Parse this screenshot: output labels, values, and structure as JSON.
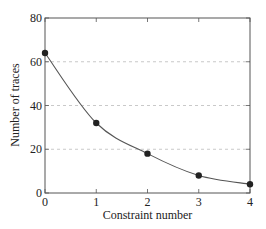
{
  "chart_data": {
    "type": "line",
    "title": "",
    "xlabel": "Constraint number",
    "ylabel": "Number of traces",
    "x": [
      0,
      1,
      2,
      3,
      4
    ],
    "series": [
      {
        "name": "Number of traces",
        "values": [
          64,
          32,
          18,
          8,
          4
        ],
        "color": "#222222",
        "marker": "circle",
        "smooth": true
      }
    ],
    "xlim": [
      0,
      4
    ],
    "ylim": [
      0,
      80
    ],
    "xticks": [
      0,
      1,
      2,
      3,
      4
    ],
    "yticks": [
      0,
      20,
      40,
      60,
      80
    ],
    "grid": {
      "y": true,
      "x": false,
      "style": "dashed",
      "color": "#bbbbbb"
    },
    "legend": null
  }
}
